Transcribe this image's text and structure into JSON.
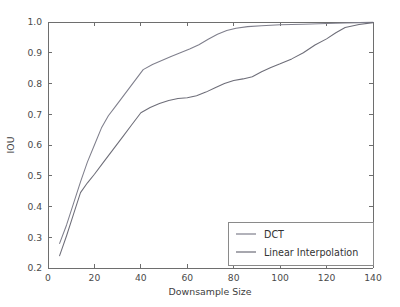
{
  "chart_data": {
    "type": "line",
    "title": "",
    "xlabel": "Downsample Size",
    "ylabel": "IOU",
    "xlim": [
      0,
      140
    ],
    "ylim": [
      0.2,
      1.0
    ],
    "xticks": [
      0,
      20,
      40,
      60,
      80,
      100,
      120,
      140
    ],
    "xticklabels": [
      "0",
      "20",
      "40",
      "60",
      "80",
      "100",
      "120",
      "140"
    ],
    "yticks": [
      0.2,
      0.3,
      0.4,
      0.5,
      0.6,
      0.7,
      0.8,
      0.9,
      1.0
    ],
    "yticklabels": [
      "0.2",
      "0.3",
      "0.4",
      "0.5",
      "0.6",
      "0.7",
      "0.8",
      "0.9",
      "1.0"
    ],
    "grid": false,
    "legend_position": "lower right",
    "series": [
      {
        "name": "DCT",
        "color": "#7f7f8c",
        "x": [
          5,
          8,
          11,
          14,
          17,
          20,
          23,
          26,
          29,
          32,
          35,
          38,
          41,
          45,
          49,
          53,
          57,
          61,
          65,
          69,
          73,
          77,
          81,
          86,
          92,
          100,
          110,
          120,
          128,
          134,
          140
        ],
        "y": [
          0.28,
          0.34,
          0.41,
          0.48,
          0.545,
          0.6,
          0.655,
          0.695,
          0.725,
          0.755,
          0.785,
          0.815,
          0.845,
          0.862,
          0.875,
          0.888,
          0.9,
          0.912,
          0.926,
          0.944,
          0.96,
          0.972,
          0.98,
          0.985,
          0.988,
          0.991,
          0.993,
          0.995,
          0.997,
          0.998,
          0.999
        ]
      },
      {
        "name": "Linear Interpolation",
        "color": "#6d6d78",
        "x": [
          5,
          8,
          11,
          14,
          17,
          20,
          24,
          28,
          32,
          36,
          40,
          44,
          48,
          52,
          56,
          60,
          64,
          68,
          72,
          76,
          80,
          84,
          88,
          92,
          96,
          100,
          105,
          110,
          115,
          120,
          124,
          128,
          134,
          140
        ],
        "y": [
          0.24,
          0.305,
          0.375,
          0.445,
          0.477,
          0.505,
          0.545,
          0.585,
          0.625,
          0.665,
          0.705,
          0.722,
          0.735,
          0.745,
          0.751,
          0.754,
          0.76,
          0.772,
          0.786,
          0.8,
          0.81,
          0.815,
          0.822,
          0.838,
          0.852,
          0.864,
          0.88,
          0.9,
          0.925,
          0.945,
          0.965,
          0.982,
          0.992,
          0.998
        ]
      }
    ]
  },
  "legend": {
    "entries": [
      {
        "label": "DCT"
      },
      {
        "label": "Linear Interpolation"
      }
    ]
  },
  "colors": {
    "axis": "#6e6e6e",
    "text": "#3d3d3d",
    "background": "#ffffff",
    "series_dct": "#7f7f8c",
    "series_linear": "#6d6d78"
  }
}
